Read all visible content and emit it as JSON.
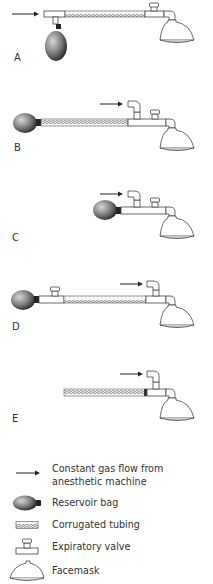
{
  "panels": [
    {
      "id": "A",
      "label": "A"
    },
    {
      "id": "B",
      "label": "B"
    },
    {
      "id": "C",
      "label": "C"
    },
    {
      "id": "D",
      "label": "D"
    },
    {
      "id": "E",
      "label": "E"
    }
  ],
  "legend": {
    "items": [
      {
        "symbol": "arrow-icon",
        "label_line1": "Constant gas flow from",
        "label_line2": "anesthetic machine"
      },
      {
        "symbol": "reservoir-bag-icon",
        "label_line1": "Reservoir bag"
      },
      {
        "symbol": "corrugated-tubing-icon",
        "label_line1": "Corrugated tubing"
      },
      {
        "symbol": "expiratory-valve-icon",
        "label_line1": "Expiratory valve"
      },
      {
        "symbol": "facemask-icon",
        "label_line1": "Facemask"
      }
    ]
  },
  "colors": {
    "line": "#444444",
    "bag_dark": "#2a2a2a",
    "bag_light": "#bdbdbd",
    "background": "#ffffff"
  }
}
